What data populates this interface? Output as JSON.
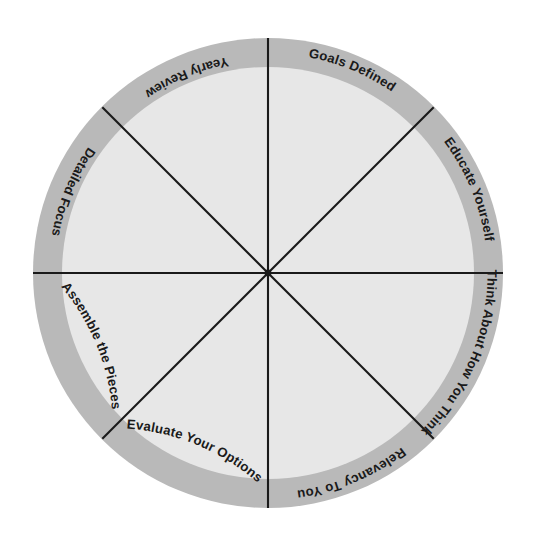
{
  "diagram": {
    "type": "radial-wheel",
    "name": "eight-segment-planning-wheel",
    "segment_count": 8,
    "colors": {
      "outer_ring": "#b9b9b9",
      "inner_disc": "#e7e7e7",
      "spoke_line": "#1a1a1a",
      "label_text": "#1a1a1a",
      "background": "#ffffff"
    },
    "geometry": {
      "center_x": 268,
      "center_y": 273,
      "outer_radius": 235,
      "inner_radius": 206,
      "ring_thickness": 29,
      "spoke_angles_deg": [
        0,
        45,
        90,
        135,
        180,
        225,
        270,
        315
      ]
    },
    "segments": [
      {
        "id": "goals-defined",
        "label": "Goals Defined",
        "position": "top-right",
        "mid_angle_deg": -67.5
      },
      {
        "id": "educate-yourself",
        "label": "Educate Yourself",
        "position": "right-upper",
        "mid_angle_deg": -22.5
      },
      {
        "id": "think-about-how-you-think",
        "label": "Think About How You Think",
        "position": "right-lower",
        "mid_angle_deg": 22.5
      },
      {
        "id": "relevancy-to-you",
        "label": "Relevancy To You",
        "position": "bottom-right",
        "mid_angle_deg": 67.5
      },
      {
        "id": "evaluate-your-options",
        "label": "Evaluate Your Options",
        "position": "bottom-left",
        "mid_angle_deg": 112.5
      },
      {
        "id": "assemble-the-pieces",
        "label": "Assemble the Pieces",
        "position": "left-lower",
        "mid_angle_deg": 157.5
      },
      {
        "id": "detailed-focus",
        "label": "Detailed Focus",
        "position": "left-upper",
        "mid_angle_deg": 202.5
      },
      {
        "id": "yearly-review",
        "label": "Yearly Review",
        "position": "top-left",
        "mid_angle_deg": 247.5
      }
    ]
  }
}
